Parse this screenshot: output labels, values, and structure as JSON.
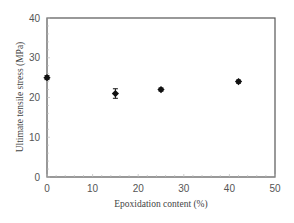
{
  "chart_data": {
    "type": "scatter",
    "title": "",
    "xlabel": "Epoxidation content (%)",
    "ylabel": "Ultimate tensile stress (MPa)",
    "xlim": [
      0,
      50
    ],
    "ylim": [
      0,
      40
    ],
    "xticks": [
      0,
      10,
      20,
      30,
      40,
      50
    ],
    "yticks": [
      0,
      10,
      20,
      30,
      40
    ],
    "grid": false,
    "legend": null,
    "series": [
      {
        "name": "Ultimate tensile stress",
        "marker": "diamond",
        "color": "#111111",
        "x": [
          0,
          15,
          25,
          42
        ],
        "y": [
          25,
          21,
          22,
          24
        ],
        "error": [
          0.5,
          1.2,
          0.4,
          0.4
        ]
      }
    ]
  },
  "axes": {
    "xlabel": "Epoxidation content (%)",
    "ylabel": "Ultimate tensile stress (MPa)",
    "xtick_labels": [
      "0",
      "10",
      "20",
      "30",
      "40",
      "50"
    ],
    "ytick_labels": [
      "0",
      "10",
      "20",
      "30",
      "40"
    ]
  },
  "colors": {
    "axis": "#555555",
    "marker": "#111111",
    "text": "#555555"
  }
}
